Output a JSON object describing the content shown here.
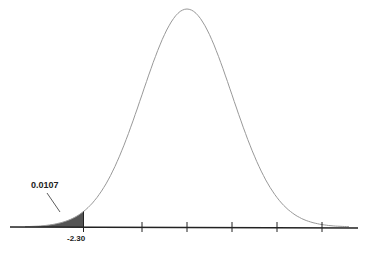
{
  "chart_data": {
    "type": "area",
    "title": "",
    "xlabel": "",
    "ylabel": "",
    "distribution": "standard normal",
    "x_ticks": [
      -2.3,
      -1,
      0,
      1,
      2,
      3
    ],
    "x_tick_labels": [
      "-2.30"
    ],
    "shaded_region": {
      "from": "-inf",
      "to": -2.3,
      "area": 0.0107
    },
    "annotation": "0.0107",
    "grid": false,
    "legend": null
  },
  "labels": {
    "area": "0.0107",
    "z": "-2.30"
  }
}
